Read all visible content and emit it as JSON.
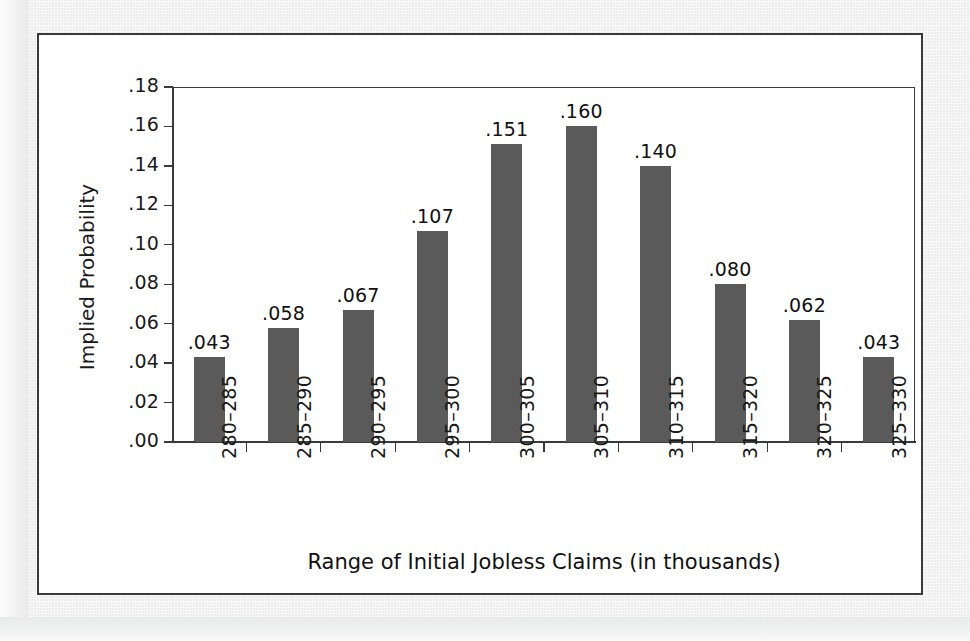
{
  "chart_data": {
    "type": "bar",
    "title": "",
    "subtitle": "",
    "xlabel": "Range of Initial Jobless Claims (in thousands)",
    "ylabel": "Implied Probability",
    "categories": [
      "280–285",
      "285–290",
      "290–295",
      "295–300",
      "300–305",
      "305–310",
      "310–315",
      "315–320",
      "320–325",
      "325–330"
    ],
    "values": [
      0.043,
      0.058,
      0.067,
      0.107,
      0.151,
      0.16,
      0.14,
      0.08,
      0.062,
      0.043
    ],
    "value_labels": [
      ".043",
      ".058",
      ".067",
      ".107",
      ".151",
      ".160",
      ".140",
      ".080",
      ".062",
      ".043"
    ],
    "ylim": [
      0.0,
      0.18
    ],
    "ytick_values": [
      0.0,
      0.02,
      0.04,
      0.06,
      0.08,
      0.1,
      0.12,
      0.14,
      0.16,
      0.18
    ],
    "ytick_labels": [
      ".00",
      ".02",
      ".04",
      ".06",
      ".08",
      ".10",
      ".12",
      ".14",
      ".16",
      ".18"
    ],
    "grid": false,
    "legend": false,
    "legend_position": "none",
    "bar_color": "#5a5a5a",
    "axis_color": "#3a3a3a",
    "plot_background": "#ffffff",
    "page_background": "#ededee",
    "frame_color": "#3b3b3b"
  }
}
